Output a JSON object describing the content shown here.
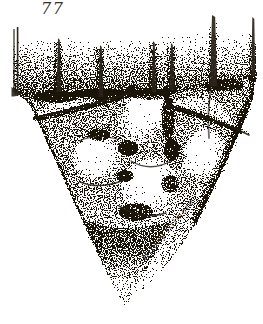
{
  "figure": {
    "number": "77"
  },
  "signature": {
    "text": "Hilary Gilmore"
  },
  "palette": {
    "ink": "#1b1409",
    "paper": "#ffffff"
  },
  "illustration": {
    "alt": "stipple pen-and-ink drawing of a V-shaped involucre holding rounded nutlets, upright awns along the rim"
  }
}
